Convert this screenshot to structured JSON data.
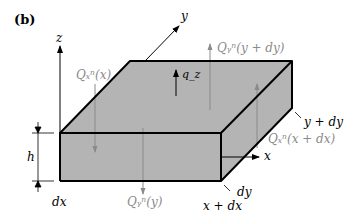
{
  "panel_label": "(b)",
  "axes": {
    "x": "x",
    "y": "y",
    "z": "z"
  },
  "labels": {
    "Qx_x": "Qₓⁿ(x)",
    "Qy_y_dy": "Qᵧⁿ(y + dy)",
    "qz": "q_z",
    "y_dy": "y + dy",
    "Qx_x_dx": "Qₓⁿ(x + dx)",
    "h": "h",
    "dx": "dx",
    "Qy_y": "Qᵧⁿ(y)",
    "dy": "dy",
    "x_dx": "x + dx"
  },
  "colors": {
    "block_fill": "#b4b4b4",
    "edge": "#000000",
    "force_arrow": "#8a8a8a",
    "axis": "#000000"
  }
}
